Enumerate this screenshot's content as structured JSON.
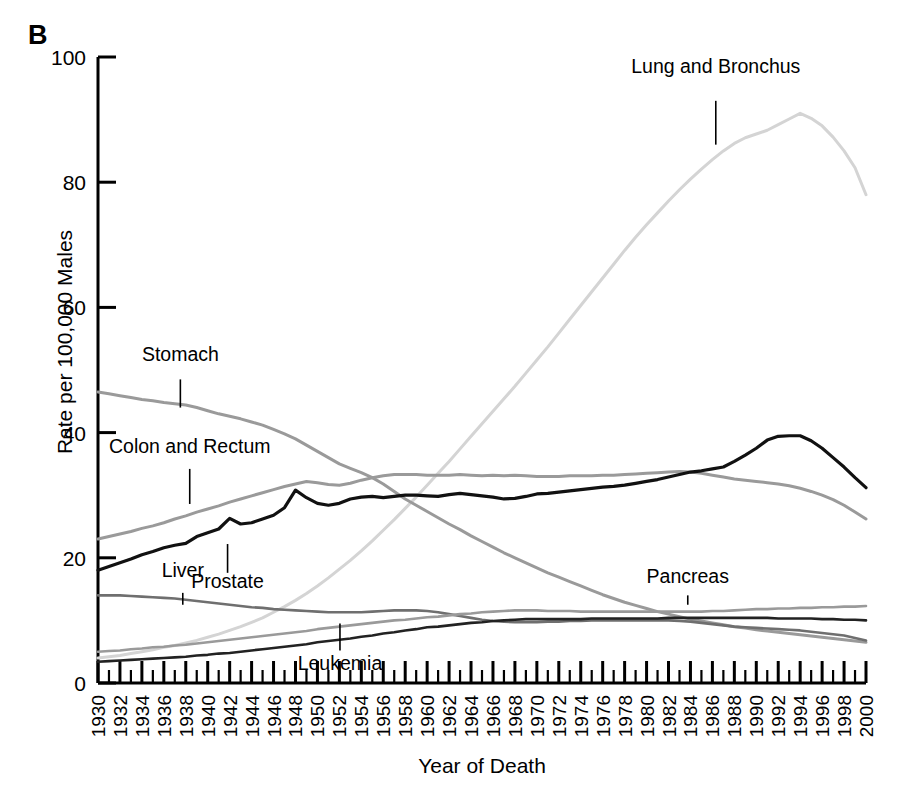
{
  "figure": {
    "panel_letter": "B",
    "ylabel": "Rate per 100,000 Males",
    "xlabel": "Year of Death"
  },
  "chart_data": {
    "type": "line",
    "title": "B",
    "xlabel": "Year of Death",
    "ylabel": "Rate per 100,000 Males",
    "xlim": [
      1930,
      2000
    ],
    "ylim": [
      0,
      100
    ],
    "grid": false,
    "legend": "inline-annotations",
    "ytick_labels": [
      "0",
      "20",
      "40",
      "60",
      "80",
      "100"
    ],
    "ytick_values": [
      0,
      20,
      40,
      60,
      80,
      100
    ],
    "xtick_labels": [
      "1930",
      "1932",
      "1934",
      "1936",
      "1938",
      "1940",
      "1942",
      "1944",
      "1946",
      "1948",
      "1950",
      "1952",
      "1954",
      "1956",
      "1958",
      "1960",
      "1962",
      "1964",
      "1966",
      "1968",
      "1970",
      "1972",
      "1974",
      "1976",
      "1978",
      "1980",
      "1982",
      "1984",
      "1986",
      "1988",
      "1990",
      "1992",
      "1994",
      "1996",
      "1998",
      "2000"
    ],
    "x": [
      1930,
      1931,
      1932,
      1933,
      1934,
      1935,
      1936,
      1937,
      1938,
      1939,
      1940,
      1941,
      1942,
      1943,
      1944,
      1945,
      1946,
      1947,
      1948,
      1949,
      1950,
      1951,
      1952,
      1953,
      1954,
      1955,
      1956,
      1957,
      1958,
      1959,
      1960,
      1961,
      1962,
      1963,
      1964,
      1965,
      1966,
      1967,
      1968,
      1969,
      1970,
      1971,
      1972,
      1973,
      1974,
      1975,
      1976,
      1977,
      1978,
      1979,
      1980,
      1981,
      1982,
      1983,
      1984,
      1985,
      1986,
      1987,
      1988,
      1989,
      1990,
      1991,
      1992,
      1993,
      1994,
      1995,
      1996,
      1997,
      1998,
      1999,
      2000
    ],
    "series": [
      {
        "name": "Lung and Bronchus",
        "color": "#d4d4d4",
        "width": 3.0,
        "label_x": 1978.6,
        "label_y_rate": 97.5,
        "leader_from_rate": 93.0,
        "leader_to_rate": 86.0,
        "values": [
          4.0,
          4.2,
          4.4,
          4.7,
          5.0,
          5.3,
          5.7,
          6.0,
          6.4,
          6.8,
          7.3,
          7.8,
          8.4,
          9.0,
          9.7,
          10.4,
          11.3,
          12.2,
          13.2,
          14.3,
          15.5,
          16.8,
          18.2,
          19.6,
          21.1,
          22.7,
          24.4,
          26.1,
          27.9,
          29.7,
          31.6,
          33.5,
          35.4,
          37.4,
          39.4,
          41.4,
          43.4,
          45.4,
          47.4,
          49.5,
          51.6,
          53.7,
          55.9,
          58.1,
          60.3,
          62.5,
          64.7,
          66.9,
          69.1,
          71.2,
          73.2,
          75.1,
          77.0,
          78.8,
          80.5,
          82.1,
          83.6,
          85.0,
          86.2,
          87.1,
          87.7,
          88.3,
          89.2,
          90.1,
          91.0,
          90.2,
          89.0,
          87.2,
          85.0,
          82.3,
          78.0
        ]
      },
      {
        "name": "Stomach",
        "color": "#9a9a9a",
        "width": 3.0,
        "label_x": 1934.0,
        "label_y_rate": 51.5,
        "leader_from_rate": 48.5,
        "leader_to_rate": 44.0,
        "values": [
          46.5,
          46.2,
          45.9,
          45.6,
          45.3,
          45.1,
          44.8,
          44.6,
          44.4,
          44.0,
          43.5,
          43.0,
          42.6,
          42.2,
          41.7,
          41.2,
          40.5,
          39.8,
          39.0,
          38.0,
          37.0,
          36.0,
          35.0,
          34.3,
          33.6,
          32.8,
          31.8,
          30.6,
          29.4,
          28.4,
          27.4,
          26.4,
          25.4,
          24.5,
          23.5,
          22.6,
          21.7,
          20.8,
          20.0,
          19.2,
          18.4,
          17.6,
          16.9,
          16.2,
          15.5,
          14.8,
          14.1,
          13.5,
          12.9,
          12.4,
          11.9,
          11.4,
          11.0,
          10.6,
          10.2,
          9.9,
          9.6,
          9.3,
          9.0,
          8.8,
          8.5,
          8.3,
          8.1,
          7.9,
          7.7,
          7.5,
          7.3,
          7.1,
          6.9,
          6.7,
          6.5
        ]
      },
      {
        "name": "Colon and Rectum",
        "color": "#9a9a9a",
        "width": 3.0,
        "label_x": 1931.0,
        "label_y_rate": 36.8,
        "leader_from_rate": 34.2,
        "leader_to_rate": 28.6,
        "values": [
          23.0,
          23.4,
          23.8,
          24.2,
          24.7,
          25.1,
          25.6,
          26.2,
          26.7,
          27.3,
          27.8,
          28.3,
          28.9,
          29.4,
          29.9,
          30.4,
          30.9,
          31.4,
          31.8,
          32.2,
          32.0,
          31.7,
          31.6,
          31.9,
          32.4,
          32.8,
          33.1,
          33.3,
          33.3,
          33.3,
          33.2,
          33.2,
          33.2,
          33.3,
          33.2,
          33.1,
          33.2,
          33.1,
          33.2,
          33.1,
          33.0,
          33.0,
          33.0,
          33.1,
          33.1,
          33.1,
          33.2,
          33.2,
          33.3,
          33.4,
          33.5,
          33.6,
          33.7,
          33.8,
          33.7,
          33.5,
          33.2,
          32.9,
          32.6,
          32.4,
          32.2,
          32.0,
          31.8,
          31.5,
          31.1,
          30.6,
          30.0,
          29.3,
          28.4,
          27.3,
          26.2
        ]
      },
      {
        "name": "Prostate",
        "color": "#111111",
        "width": 3.2,
        "label_x": 1938.5,
        "label_y_rate": 15.2,
        "leader_from_rate": 22.2,
        "leader_to_rate": 17.6,
        "values": [
          18.0,
          18.6,
          19.2,
          19.8,
          20.5,
          21.0,
          21.6,
          22.0,
          22.3,
          23.4,
          24.0,
          24.6,
          26.3,
          25.4,
          25.6,
          26.2,
          26.8,
          28.0,
          30.8,
          29.6,
          28.7,
          28.4,
          28.7,
          29.4,
          29.7,
          29.8,
          29.6,
          29.8,
          30.0,
          30.0,
          29.9,
          29.8,
          30.1,
          30.3,
          30.1,
          29.9,
          29.7,
          29.4,
          29.5,
          29.8,
          30.2,
          30.3,
          30.5,
          30.7,
          30.9,
          31.1,
          31.3,
          31.4,
          31.6,
          31.9,
          32.2,
          32.5,
          32.9,
          33.3,
          33.7,
          33.9,
          34.2,
          34.5,
          35.4,
          36.4,
          37.5,
          38.8,
          39.4,
          39.5,
          39.5,
          38.7,
          37.5,
          36.0,
          34.5,
          32.8,
          31.2
        ]
      },
      {
        "name": "Liver",
        "color": "#6f6f6f",
        "width": 2.6,
        "label_x": 1935.8,
        "label_y_rate": 17.0,
        "leader_from_rate": 14.4,
        "leader_to_rate": 12.5,
        "values": [
          14.0,
          14.0,
          14.0,
          13.9,
          13.8,
          13.7,
          13.6,
          13.5,
          13.3,
          13.1,
          12.9,
          12.7,
          12.5,
          12.3,
          12.1,
          12.0,
          11.8,
          11.7,
          11.6,
          11.5,
          11.4,
          11.3,
          11.3,
          11.3,
          11.3,
          11.4,
          11.5,
          11.6,
          11.6,
          11.6,
          11.5,
          11.3,
          11.0,
          10.7,
          10.4,
          10.1,
          9.9,
          9.8,
          9.7,
          9.7,
          9.7,
          9.8,
          9.8,
          9.9,
          9.9,
          10.0,
          10.0,
          10.0,
          10.0,
          10.0,
          10.0,
          10.0,
          10.0,
          9.9,
          9.8,
          9.6,
          9.4,
          9.2,
          9.0,
          8.9,
          8.8,
          8.7,
          8.6,
          8.5,
          8.4,
          8.2,
          8.0,
          7.8,
          7.6,
          7.2,
          6.8
        ]
      },
      {
        "name": "Pancreas",
        "color": "#9a9a9a",
        "width": 2.6,
        "label_x": 1980.0,
        "label_y_rate": 15.9,
        "leader_from_rate": 14.0,
        "leader_to_rate": 12.5,
        "values": [
          5.0,
          5.1,
          5.2,
          5.4,
          5.5,
          5.7,
          5.8,
          6.0,
          6.1,
          6.3,
          6.5,
          6.7,
          6.9,
          7.1,
          7.3,
          7.5,
          7.7,
          7.9,
          8.1,
          8.3,
          8.6,
          8.8,
          9.0,
          9.2,
          9.4,
          9.6,
          9.8,
          10.0,
          10.1,
          10.3,
          10.5,
          10.6,
          10.8,
          11.0,
          11.1,
          11.3,
          11.4,
          11.5,
          11.6,
          11.6,
          11.6,
          11.5,
          11.5,
          11.5,
          11.4,
          11.4,
          11.4,
          11.4,
          11.4,
          11.4,
          11.4,
          11.4,
          11.4,
          11.4,
          11.4,
          11.4,
          11.5,
          11.5,
          11.6,
          11.7,
          11.8,
          11.8,
          11.9,
          11.9,
          12.0,
          12.0,
          12.1,
          12.1,
          12.2,
          12.2,
          12.3
        ]
      },
      {
        "name": "Leukemia",
        "color": "#222222",
        "width": 2.6,
        "label_x": 1948.2,
        "label_y_rate": 2.0,
        "leader_from_rate": 9.5,
        "leader_to_rate": 5.2,
        "values": [
          3.4,
          3.5,
          3.6,
          3.7,
          3.8,
          3.9,
          4.0,
          4.1,
          4.2,
          4.4,
          4.5,
          4.7,
          4.8,
          5.0,
          5.2,
          5.4,
          5.6,
          5.8,
          6.0,
          6.2,
          6.5,
          6.7,
          6.9,
          7.1,
          7.4,
          7.6,
          7.9,
          8.1,
          8.4,
          8.6,
          8.9,
          9.0,
          9.2,
          9.4,
          9.6,
          9.7,
          9.9,
          10.0,
          10.1,
          10.2,
          10.2,
          10.2,
          10.2,
          10.2,
          10.2,
          10.3,
          10.3,
          10.3,
          10.3,
          10.3,
          10.3,
          10.3,
          10.4,
          10.4,
          10.4,
          10.4,
          10.4,
          10.4,
          10.4,
          10.4,
          10.4,
          10.4,
          10.3,
          10.3,
          10.3,
          10.3,
          10.2,
          10.2,
          10.1,
          10.1,
          10.0
        ]
      }
    ]
  }
}
